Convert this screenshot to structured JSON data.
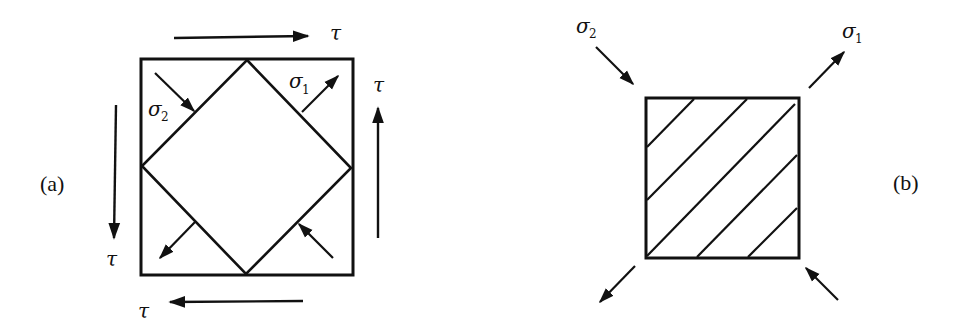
{
  "panels": {
    "a": {
      "label": "(a)",
      "shear_labels": {
        "top": "τ",
        "right": "τ",
        "left": "τ",
        "bottom": "τ"
      },
      "principal_labels": {
        "sigma2": {
          "symbol": "σ",
          "subscript": "2"
        },
        "sigma1": {
          "symbol": "σ",
          "subscript": "1"
        }
      }
    },
    "b": {
      "label": "(b)",
      "principal_labels": {
        "sigma2": {
          "symbol": "σ",
          "subscript": "2"
        },
        "sigma1": {
          "symbol": "σ",
          "subscript": "1"
        }
      },
      "hatch_lines": 5
    }
  },
  "colors": {
    "stroke": "#111111",
    "background": "#ffffff"
  }
}
